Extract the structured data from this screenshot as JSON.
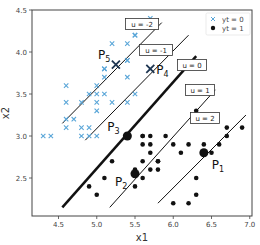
{
  "chart_data": {
    "type": "scatter",
    "title": "",
    "xlabel": "x1",
    "ylabel": "x2",
    "xlim": [
      4.2,
      7.05
    ],
    "ylim": [
      2.1,
      4.5
    ],
    "xticks": [
      "4.5",
      "5.0",
      "5.5",
      "6.0",
      "6.5",
      "7.0"
    ],
    "yticks": [
      "2.5",
      "3.0",
      "3.5",
      "4.0",
      "4.5"
    ],
    "grid": false,
    "legend": {
      "position": "upper right",
      "entries": [
        {
          "label": "yt = 0",
          "marker": "x",
          "color": "#5aa6d8"
        },
        {
          "label": "yt = 1",
          "marker": "o",
          "color": "#111111"
        }
      ]
    },
    "series": [
      {
        "name": "yt = 0",
        "marker": "x",
        "color": "#5aa6d8",
        "points": [
          [
            5.7,
            4.4
          ],
          [
            5.4,
            4.1
          ],
          [
            5.2,
            4.1
          ],
          [
            5.5,
            4.2
          ],
          [
            5.8,
            4.0
          ],
          [
            5.1,
            3.5
          ],
          [
            5.1,
            3.8
          ],
          [
            5.4,
            3.9
          ],
          [
            5.4,
            3.7
          ],
          [
            5.5,
            3.5
          ],
          [
            5.0,
            3.6
          ],
          [
            5.0,
            3.4
          ],
          [
            5.4,
            3.4
          ],
          [
            4.8,
            3.4
          ],
          [
            5.1,
            3.7
          ],
          [
            4.6,
            3.6
          ],
          [
            5.0,
            3.5
          ],
          [
            4.9,
            3.5
          ],
          [
            4.8,
            3.0
          ],
          [
            4.6,
            3.4
          ],
          [
            4.6,
            3.2
          ],
          [
            4.7,
            3.2
          ],
          [
            4.9,
            3.1
          ],
          [
            4.4,
            3.0
          ],
          [
            4.9,
            3.0
          ],
          [
            5.0,
            3.3
          ],
          [
            4.8,
            3.1
          ],
          [
            4.3,
            3.0
          ],
          [
            4.6,
            3.1
          ],
          [
            5.0,
            3.0
          ],
          [
            5.7,
            3.8
          ],
          [
            5.1,
            3.8
          ],
          [
            5.2,
            3.4
          ],
          [
            5.4,
            3.9
          ],
          [
            5.5,
            4.2
          ]
        ]
      },
      {
        "name": "yt = 1",
        "marker": "o",
        "color": "#111111",
        "points": [
          [
            6.3,
            3.3
          ],
          [
            6.9,
            3.1
          ],
          [
            6.7,
            3.1
          ],
          [
            6.2,
            2.9
          ],
          [
            6.4,
            2.9
          ],
          [
            6.6,
            2.9
          ],
          [
            6.7,
            3.0
          ],
          [
            6.5,
            2.8
          ],
          [
            6.0,
            2.9
          ],
          [
            5.9,
            3.0
          ],
          [
            5.7,
            2.8
          ],
          [
            5.6,
            2.9
          ],
          [
            5.6,
            3.0
          ],
          [
            5.7,
            2.9
          ],
          [
            5.8,
            2.7
          ],
          [
            5.6,
            2.7
          ],
          [
            5.7,
            2.6
          ],
          [
            5.5,
            2.6
          ],
          [
            5.8,
            2.6
          ],
          [
            6.1,
            2.8
          ],
          [
            6.3,
            2.5
          ],
          [
            6.3,
            2.3
          ],
          [
            6.0,
            2.2
          ],
          [
            6.2,
            2.2
          ],
          [
            5.5,
            2.4
          ],
          [
            5.2,
            2.7
          ],
          [
            5.1,
            2.5
          ],
          [
            5.0,
            2.3
          ],
          [
            4.9,
            2.4
          ],
          [
            5.6,
            2.5
          ],
          [
            5.7,
            3.0
          ],
          [
            5.6,
            3.0
          ],
          [
            5.8,
            2.7
          ]
        ]
      }
    ],
    "special_points": [
      {
        "label": "P",
        "sub": "1",
        "x": 6.4,
        "y": 2.8,
        "marker": "o-large"
      },
      {
        "label": "P",
        "sub": "2",
        "x": 5.5,
        "y": 2.55,
        "marker": "o-large"
      },
      {
        "label": "P",
        "sub": "3",
        "x": 5.4,
        "y": 3.0,
        "marker": "o-large"
      },
      {
        "label": "P",
        "sub": "4",
        "x": 5.7,
        "y": 3.8,
        "marker": "x-large"
      },
      {
        "label": "P",
        "sub": "5",
        "x": 5.25,
        "y": 3.85,
        "marker": "x-large"
      }
    ],
    "contour_lines": [
      {
        "label": "u = -2",
        "x1": 4.55,
        "y1": 3.15,
        "x2": 5.85,
        "y2": 4.35,
        "width": 1
      },
      {
        "label": "u = -1",
        "x1": 4.85,
        "y1": 2.95,
        "x2": 6.2,
        "y2": 4.2,
        "width": 1
      },
      {
        "label": "u = 0",
        "x1": 4.55,
        "y1": 2.15,
        "x2": 6.3,
        "y2": 3.95,
        "width": 2.5
      },
      {
        "label": "u = 1",
        "x1": 5.17,
        "y1": 2.15,
        "x2": 6.55,
        "y2": 3.55,
        "width": 1
      },
      {
        "label": "u = 2",
        "x1": 5.8,
        "y1": 2.2,
        "x2": 6.95,
        "y2": 3.25,
        "width": 1
      }
    ]
  }
}
